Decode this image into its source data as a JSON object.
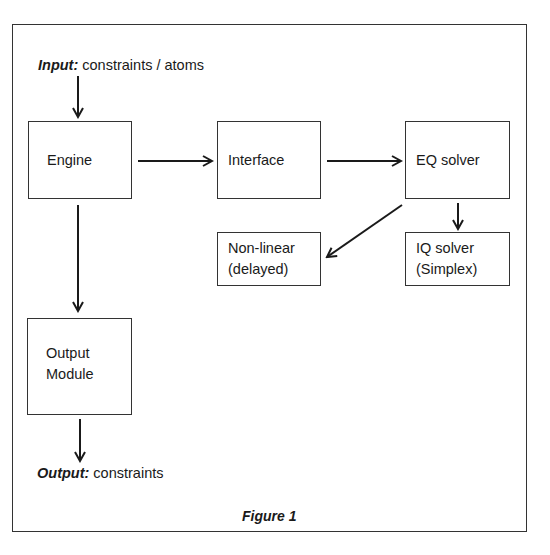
{
  "figure": {
    "caption": "Figure 1",
    "input": {
      "prefix": "Input:",
      "text": " constraints / atoms"
    },
    "output": {
      "prefix": "Output:",
      "text": " constraints"
    },
    "nodes": {
      "engine": {
        "label": "Engine"
      },
      "interface": {
        "label": "Interface"
      },
      "eq_solver": {
        "label": "EQ solver"
      },
      "non_linear": {
        "line1": "Non-linear",
        "line2": "(delayed)"
      },
      "iq_solver": {
        "line1": "IQ solver",
        "line2": "(Simplex)"
      },
      "output_module": {
        "line1": "Output",
        "line2": "Module"
      }
    },
    "edges": [
      {
        "from": "input",
        "to": "engine"
      },
      {
        "from": "engine",
        "to": "interface"
      },
      {
        "from": "interface",
        "to": "eq_solver"
      },
      {
        "from": "eq_solver",
        "to": "non_linear"
      },
      {
        "from": "eq_solver",
        "to": "iq_solver"
      },
      {
        "from": "engine",
        "to": "output_module"
      },
      {
        "from": "output_module",
        "to": "output"
      }
    ],
    "colors": {
      "stroke": "#1a1a1a",
      "background": "#ffffff"
    }
  }
}
